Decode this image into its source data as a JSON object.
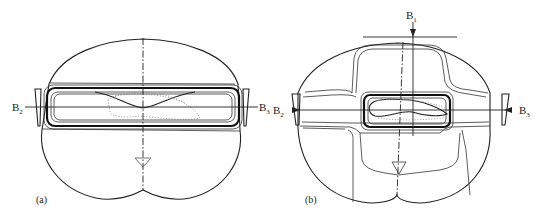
{
  "figure": {
    "panels": [
      {
        "id": "a",
        "caption": "(a)",
        "labels": {
          "left": {
            "main": "B",
            "sub": "2"
          },
          "right": {
            "main": "B",
            "sub": "3"
          }
        }
      },
      {
        "id": "b",
        "caption": "(b)",
        "labels": {
          "top": {
            "main": "B",
            "sub": "1"
          },
          "left": {
            "main": "B",
            "sub": "2"
          },
          "right": {
            "main": "B",
            "sub": "3"
          }
        }
      }
    ],
    "colors": {
      "line": "#222222",
      "background": "#ffffff",
      "dotted": "#888888"
    }
  }
}
